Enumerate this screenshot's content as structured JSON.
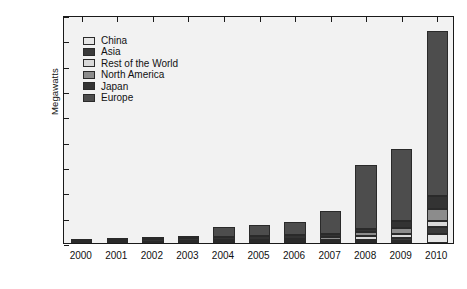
{
  "chart_data": {
    "type": "bar",
    "stacked": true,
    "title": "",
    "xlabel": "",
    "ylabel": "Megawatts",
    "ylim": [
      0,
      18000
    ],
    "ytick_step": 2000,
    "grid": false,
    "legend_position": "upper-left-inside",
    "categories": [
      "2000",
      "2001",
      "2002",
      "2003",
      "2004",
      "2005",
      "2006",
      "2007",
      "2008",
      "2009",
      "2010"
    ],
    "ytick_labels": [
      "0",
      "2,000",
      "4,000",
      "6,000",
      "8,000",
      "10,000",
      "12,000",
      "14,000",
      "16,000",
      "18,000"
    ],
    "ytick_values": [
      0,
      2000,
      4000,
      6000,
      8000,
      10000,
      12000,
      14000,
      16000,
      18000
    ],
    "series": [
      {
        "name": "Europe",
        "color": "#4d4d4d",
        "values": [
          70,
          110,
          150,
          230,
          750,
          900,
          1000,
          1800,
          5000,
          5700,
          13000
        ]
      },
      {
        "name": "Japan",
        "color": "#333333",
        "values": [
          110,
          130,
          180,
          220,
          270,
          290,
          290,
          220,
          230,
          480,
          990
        ]
      },
      {
        "name": "North America",
        "color": "#8c8c8c",
        "values": [
          25,
          35,
          45,
          65,
          110,
          115,
          160,
          220,
          350,
          500,
          990
        ]
      },
      {
        "name": "Rest of the World",
        "color": "#d9d9d9",
        "values": [
          15,
          20,
          25,
          35,
          55,
          70,
          90,
          130,
          300,
          300,
          420
        ]
      },
      {
        "name": "Asia",
        "color": "#3a3a3a",
        "values": [
          10,
          15,
          20,
          30,
          45,
          60,
          80,
          110,
          200,
          240,
          600
        ]
      },
      {
        "name": "China",
        "color": "#e6e6e6",
        "values": [
          5,
          5,
          10,
          10,
          15,
          20,
          25,
          30,
          50,
          180,
          700
        ]
      }
    ],
    "totals": [
      235,
      315,
      430,
      590,
      1245,
      1455,
      1645,
      2510,
      6130,
      7400,
      16700
    ],
    "legend_order": [
      "China",
      "Asia",
      "Rest of the World",
      "North America",
      "Japan",
      "Europe"
    ],
    "stack_order_bottom_to_top": [
      "China",
      "Asia",
      "Rest of the World",
      "North America",
      "Japan",
      "Europe"
    ]
  },
  "style": {
    "plot_background": "#f2f2f2",
    "frame_color": "#1a1a1a",
    "page_background": "#ffffff"
  }
}
